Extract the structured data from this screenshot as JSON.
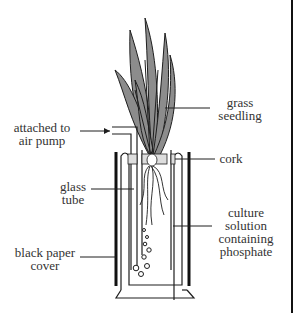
{
  "diagram": {
    "type": "labelled apparatus diagram",
    "colors": {
      "leaf_fill": "#8c8c8c",
      "outline": "#1e1e1e",
      "background": "#ffffff"
    },
    "labels": {
      "grass_seedling": [
        "grass",
        "seedling"
      ],
      "air_pump": [
        "attached to",
        "air pump"
      ],
      "cork": [
        "cork"
      ],
      "glass_tube": [
        "glass",
        "tube"
      ],
      "culture_solution": [
        "culture",
        "solution",
        "containing",
        "phosphate"
      ],
      "black_paper": [
        "black paper",
        "cover"
      ]
    }
  }
}
